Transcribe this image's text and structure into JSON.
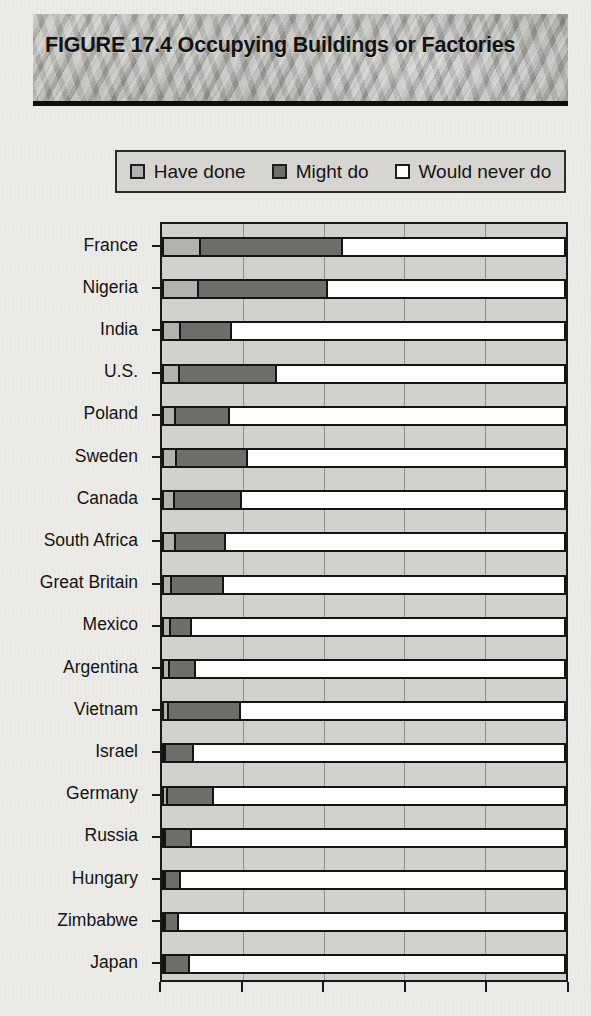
{
  "figure": {
    "title": "FIGURE 17.4  Occupying Buildings or Factories"
  },
  "legend": {
    "items": [
      {
        "label": "Have done",
        "color": "#b3b2ae",
        "icon": "square-swatch-icon"
      },
      {
        "label": "Might do",
        "color": "#6e6d69",
        "icon": "square-swatch-icon"
      },
      {
        "label": "Would never do",
        "color": "#ffffff",
        "icon": "square-swatch-icon"
      }
    ]
  },
  "chart_data": {
    "type": "bar",
    "orientation": "horizontal",
    "stacked": true,
    "title": "FIGURE 17.4  Occupying Buildings or Factories",
    "xlabel": "",
    "ylabel": "",
    "xlim": [
      0,
      100
    ],
    "xticks": [
      0,
      20,
      40,
      60,
      80,
      100
    ],
    "xtick_labels": [
      "",
      "",
      "",
      "",
      "",
      ""
    ],
    "grid": true,
    "legend_position": "top",
    "categories": [
      "France",
      "Nigeria",
      "India",
      "U.S.",
      "Poland",
      "Sweden",
      "Canada",
      "South Africa",
      "Great Britain",
      "Mexico",
      "Argentina",
      "Vietnam",
      "Israel",
      "Germany",
      "Russia",
      "Hungary",
      "Zimbabwe",
      "Japan"
    ],
    "series": [
      {
        "name": "Have done",
        "color": "#b3b2ae",
        "values": [
          9.3,
          8.8,
          4.2,
          3.9,
          2.9,
          3.2,
          2.7,
          2.9,
          2.0,
          1.7,
          1.5,
          1.2,
          0.5,
          1.0,
          0.2,
          0.5,
          0.2,
          0.2
        ]
      },
      {
        "name": "Might do",
        "color": "#6e6d69",
        "values": [
          35.5,
          32.1,
          12.7,
          24.3,
          13.7,
          17.9,
          16.7,
          12.5,
          12.9,
          5.4,
          6.4,
          18.1,
          7.1,
          11.6,
          6.6,
          3.7,
          3.2,
          5.9
        ]
      },
      {
        "name": "Would never do",
        "color": "#ffffff",
        "values": [
          55.2,
          59.1,
          83.1,
          71.8,
          83.4,
          78.9,
          80.6,
          84.6,
          85.1,
          92.9,
          92.1,
          80.7,
          92.4,
          87.4,
          93.2,
          95.8,
          96.6,
          93.9
        ]
      }
    ]
  }
}
